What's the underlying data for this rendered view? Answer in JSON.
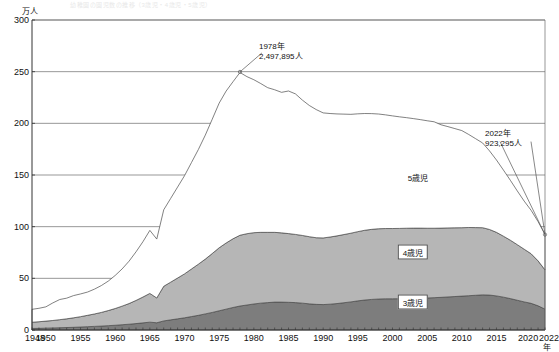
{
  "header": {
    "faint_title": "幼稚園の園児数の推移（3歳児・4歳児・5歳児）"
  },
  "chart_data": {
    "type": "area",
    "stacked": true,
    "title": "",
    "xlabel": "年",
    "ylabel": "万人",
    "y_unit_label": "万人",
    "x_unit_label": "年",
    "ylim": [
      0,
      300
    ],
    "xlim": [
      1948,
      2022
    ],
    "grid": true,
    "legend_position": "inline-on-bands",
    "yticks": [
      0,
      50,
      100,
      150,
      200,
      250,
      300
    ],
    "xticks": [
      1948,
      1950,
      1955,
      1960,
      1965,
      1970,
      1975,
      1980,
      1985,
      1990,
      1995,
      2000,
      2005,
      2010,
      2015,
      2020,
      2022
    ],
    "x": [
      1948,
      1949,
      1950,
      1951,
      1952,
      1953,
      1954,
      1955,
      1956,
      1957,
      1958,
      1959,
      1960,
      1961,
      1962,
      1963,
      1964,
      1965,
      1966,
      1967,
      1968,
      1969,
      1970,
      1971,
      1972,
      1973,
      1974,
      1975,
      1976,
      1977,
      1978,
      1979,
      1980,
      1981,
      1982,
      1983,
      1984,
      1985,
      1986,
      1987,
      1988,
      1989,
      1990,
      1991,
      1992,
      1993,
      1994,
      1995,
      1996,
      1997,
      1998,
      1999,
      2000,
      2001,
      2002,
      2003,
      2004,
      2005,
      2006,
      2007,
      2008,
      2009,
      2010,
      2011,
      2012,
      2013,
      2014,
      2015,
      2016,
      2017,
      2018,
      2019,
      2020,
      2021,
      2022
    ],
    "series": [
      {
        "name": "3歳児",
        "color": "#7d7d7d",
        "values": [
          1.5,
          1.6,
          1.8,
          2.0,
          2.2,
          2.4,
          2.6,
          2.9,
          3.2,
          3.5,
          3.8,
          4.2,
          4.6,
          5.1,
          5.6,
          6.2,
          6.9,
          7.6,
          7.0,
          8.8,
          9.8,
          10.8,
          11.8,
          13.0,
          14.2,
          15.6,
          17.0,
          18.6,
          20.2,
          21.8,
          23.2,
          24.2,
          25.2,
          26.0,
          26.5,
          27.0,
          27.0,
          26.8,
          26.5,
          26.0,
          25.3,
          24.8,
          24.6,
          25.0,
          25.6,
          26.4,
          27.2,
          28.2,
          29.0,
          29.6,
          30.0,
          30.2,
          30.2,
          30.3,
          30.5,
          30.6,
          30.8,
          31.0,
          31.3,
          31.6,
          32.0,
          32.4,
          32.8,
          33.2,
          33.6,
          34.0,
          33.8,
          33.0,
          31.8,
          30.4,
          28.8,
          27.2,
          25.8,
          23.4,
          20.2
        ]
      },
      {
        "name": "4歳児",
        "color": "#b6b6b6",
        "values": [
          6.0,
          6.4,
          6.8,
          7.2,
          7.8,
          8.4,
          9.2,
          10.0,
          11.0,
          12.0,
          13.2,
          14.6,
          16.2,
          18.0,
          20.0,
          22.4,
          25.0,
          27.8,
          24.0,
          33.5,
          36.5,
          39.5,
          42.5,
          46.0,
          49.5,
          53.0,
          57.0,
          61.0,
          64.0,
          66.5,
          68.5,
          69.0,
          69.0,
          68.5,
          68.0,
          67.5,
          67.0,
          66.5,
          66.0,
          65.5,
          65.0,
          64.5,
          64.5,
          65.0,
          65.5,
          66.0,
          66.5,
          67.0,
          67.5,
          67.8,
          68.0,
          68.0,
          68.0,
          68.0,
          68.0,
          68.0,
          67.8,
          67.5,
          67.2,
          67.0,
          66.8,
          66.5,
          66.2,
          66.0,
          65.5,
          65.0,
          63.5,
          61.5,
          59.0,
          56.5,
          53.8,
          51.0,
          48.0,
          43.5,
          38.0
        ]
      },
      {
        "name": "5歳児",
        "color": "#ffffff",
        "values": [
          12.5,
          13.0,
          13.8,
          17.0,
          19.5,
          20.0,
          21.5,
          22.0,
          22.5,
          24.0,
          26.0,
          28.5,
          32.0,
          36.0,
          41.0,
          47.0,
          53.5,
          61.0,
          57.0,
          74.0,
          81.0,
          88.0,
          95.0,
          103.0,
          111.0,
          120.0,
          130.0,
          140.0,
          147.0,
          152.0,
          157.5,
          152.0,
          148.0,
          144.0,
          140.0,
          138.0,
          136.0,
          138.0,
          136.0,
          131.0,
          127.0,
          124.0,
          121.0,
          119.5,
          118.0,
          116.5,
          115.0,
          114.0,
          113.0,
          112.0,
          111.0,
          110.0,
          109.0,
          108.0,
          107.0,
          106.0,
          105.0,
          104.0,
          103.0,
          100.0,
          98.0,
          96.0,
          94.0,
          90.0,
          86.0,
          82.0,
          76.0,
          70.0,
          64.0,
          58.0,
          52.0,
          46.5,
          42.0,
          38.0,
          34.2
        ]
      }
    ],
    "totals": [
      20.0,
      21.0,
      22.4,
      26.2,
      29.5,
      30.8,
      33.3,
      34.9,
      36.7,
      39.5,
      43.0,
      47.3,
      52.8,
      59.1,
      66.6,
      75.6,
      85.4,
      96.4,
      88.0,
      116.3,
      127.3,
      138.3,
      149.3,
      162.0,
      174.7,
      188.6,
      204.0,
      219.6,
      231.2,
      240.3,
      249.2,
      245.2,
      242.2,
      238.5,
      234.5,
      232.5,
      230.0,
      231.3,
      228.5,
      222.5,
      217.3,
      213.3,
      210.1,
      209.5,
      209.1,
      208.9,
      208.7,
      209.2,
      209.5,
      209.4,
      209.0,
      208.2,
      207.2,
      206.3,
      205.5,
      204.6,
      203.6,
      202.5,
      201.5,
      198.6,
      196.8,
      194.9,
      193.0,
      189.2,
      185.1,
      181.0,
      173.3,
      164.5,
      154.8,
      144.9,
      134.6,
      124.7,
      115.8,
      104.9,
      92.4
    ],
    "annotations": [
      {
        "name": "peak-annotation",
        "year": 1978,
        "year_label": "1978年",
        "value_label": "2,497,895人",
        "value": 2497895,
        "value_man": 249.79
      },
      {
        "name": "latest-annotation",
        "year": 2022,
        "year_label": "2022年",
        "value_label": "923,295人",
        "value": 923295,
        "value_man": 92.33
      }
    ],
    "band_labels": [
      {
        "name": "5歳児",
        "boxed": false
      },
      {
        "name": "4歳児",
        "boxed": true
      },
      {
        "name": "3歳児",
        "boxed": true
      }
    ]
  }
}
